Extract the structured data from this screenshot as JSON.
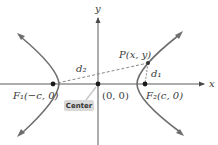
{
  "diagram": {
    "type": "hyperbola-foci-diagram",
    "axes": {
      "x_label": "x",
      "y_label": "y"
    },
    "points": {
      "origin": {
        "label": "(0, 0)"
      },
      "focus1": {
        "label": "F₁(−c, 0)"
      },
      "focus2": {
        "label": "F₂(c, 0)"
      },
      "point_p": {
        "label": "P(x, y)"
      }
    },
    "distances": {
      "d1": "d₁",
      "d2": "d₂"
    },
    "callout": {
      "label": "Center"
    },
    "colors": {
      "curve": "#6e6e6e",
      "axis": "#5a5a5a",
      "dashed": "#7a7a7a",
      "point": "#1a1a1a",
      "callout_bg": "#d9d9d9"
    }
  }
}
